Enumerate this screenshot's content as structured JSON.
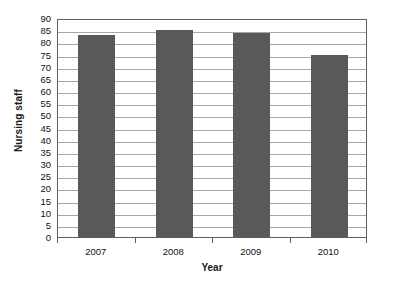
{
  "chart_data": {
    "type": "bar",
    "title": "",
    "subtitle": "",
    "xlabel": "Year",
    "ylabel": "Nursing staff",
    "categories": [
      "2007",
      "2008",
      "2009",
      "2010"
    ],
    "values": [
      83,
      85,
      84,
      75
    ],
    "series": [
      {
        "name": "Nursing staff",
        "values": [
          83,
          85,
          84,
          75
        ]
      }
    ],
    "ylim": [
      0,
      90
    ],
    "ytick_step": 5,
    "yticks": [
      90,
      85,
      80,
      75,
      70,
      65,
      60,
      55,
      50,
      45,
      40,
      35,
      30,
      25,
      20,
      15,
      10,
      5,
      0
    ],
    "ytick_labels": [
      "90",
      "85",
      "80",
      "75",
      "70",
      "65",
      "60",
      "55",
      "50",
      "45",
      "40",
      "35",
      "30",
      "25",
      "20",
      "15",
      "10",
      "5",
      "0"
    ],
    "grid": true,
    "grid_axis": "y",
    "legend": false,
    "legend_position": "none",
    "annotations": [],
    "colors": {
      "bar": "#595959",
      "gridline": "#a8a8a8",
      "axis": "#5e5e5e",
      "text": "#111111",
      "axis_title": "#1a1a1a",
      "plot_background": "#ffffff",
      "figure_background": "#ffffff"
    }
  }
}
